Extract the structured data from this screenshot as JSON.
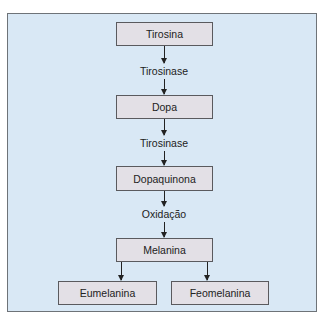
{
  "diagram": {
    "type": "flowchart",
    "nodes": {
      "tirosina": "Tirosina",
      "dopa": "Dopa",
      "dopaquinona": "Dopaquinona",
      "melanina": "Melanina",
      "eumelanina": "Eumelanina",
      "feomelanina": "Feomelanina"
    },
    "edges": {
      "tirosina_dopa": "Tirosinase",
      "dopa_dopaquinona": "Tirosinase",
      "dopaquinona_melanina": "Oxidação"
    },
    "colors": {
      "panel_bg": "#d9e8f5",
      "box_bg": "#e3e0e6",
      "border": "#5a5a5e"
    }
  }
}
